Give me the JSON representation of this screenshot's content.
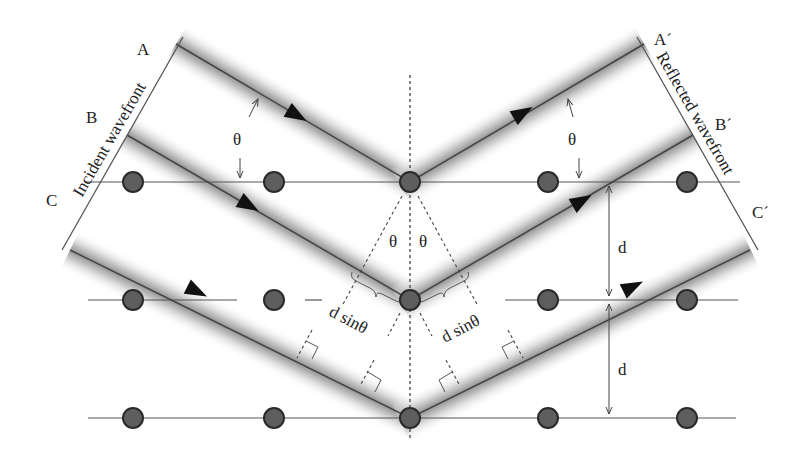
{
  "diagram": {
    "labels": {
      "A": "A",
      "B": "B",
      "C": "C",
      "A_prime": "A´",
      "B_prime": "B´",
      "C_prime": "C´",
      "incident_wavefront": "Incident wavefront",
      "reflected_wavefront": "Reflected wavefront",
      "theta": "θ",
      "d": "d",
      "d_sin_theta": "d sinθ"
    },
    "lattice": {
      "rows_y": [
        182,
        300,
        418
      ],
      "atoms_x": [
        133,
        274,
        410,
        548,
        687
      ],
      "spacing_label": "d"
    },
    "rays": [
      {
        "id": "A",
        "incident_start": [
          176,
          44
        ],
        "vertex": [
          410,
          182
        ],
        "reflected_end": [
          644,
          44
        ],
        "end_label": "A´"
      },
      {
        "id": "B",
        "incident_start": [
          127,
          135
        ],
        "vertex": [
          410,
          300
        ],
        "reflected_end": [
          693,
          135
        ],
        "end_label": "B´"
      },
      {
        "id": "C",
        "incident_start": [
          70,
          250
        ],
        "vertex": [
          410,
          418
        ],
        "reflected_end": [
          750,
          250
        ],
        "end_label": "C´"
      }
    ],
    "colors": {
      "line": "#555555",
      "atom_fill": "#5a5a5a",
      "atom_stroke": "#2a2a2a",
      "beam_shade": "#9a9a9a",
      "arrowhead": "#111111",
      "text": "#222222"
    }
  }
}
